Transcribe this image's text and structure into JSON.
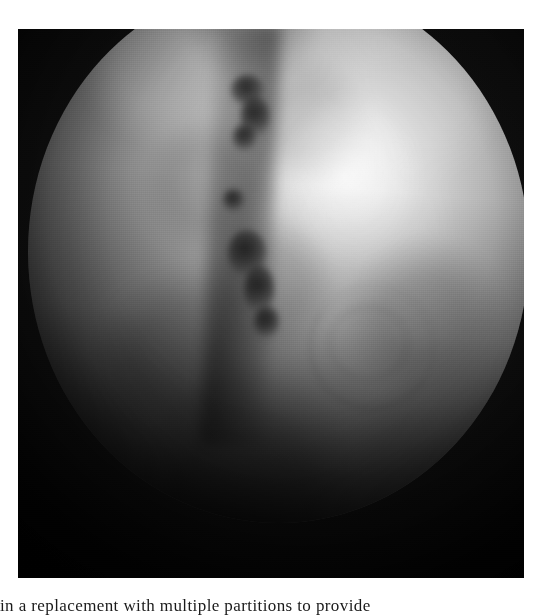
{
  "page": {
    "background_color": "#ffffff",
    "width": 552,
    "height": 616
  },
  "figure": {
    "name": "endoscopic-photograph",
    "modality": "endoscopy",
    "color_mode": "grayscale",
    "field_of_view_shape": "circle",
    "panel_background": "#000000",
    "highlight_color": "#f2f2f2",
    "shadow_color": "#050505",
    "alt": "Grayscale endoscopic photograph showing a circular field of view with a brightly illuminated mucosal surface and a vertical chain of dark lesions left of centre"
  },
  "caption": {
    "text": "in a replacement with multiple partitions to provide",
    "clipped": true
  }
}
